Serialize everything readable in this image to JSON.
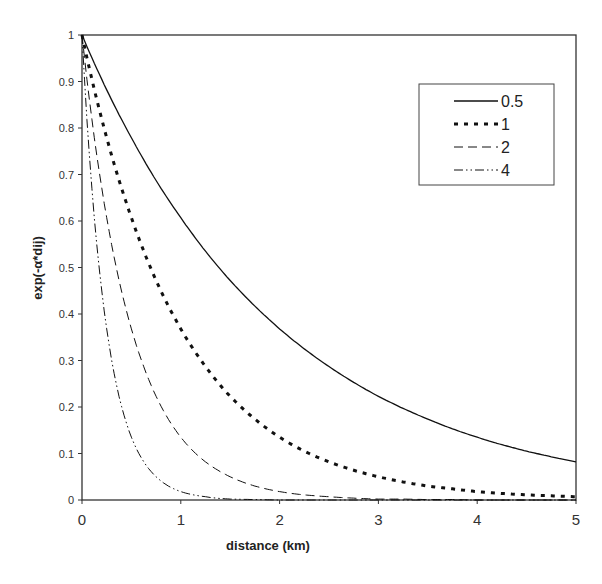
{
  "chart_data": {
    "type": "line",
    "title": "",
    "xlabel": "distance (km)",
    "ylabel": "exp(-α*dij)",
    "xlim": [
      0,
      5
    ],
    "ylim": [
      0,
      1
    ],
    "x_ticks": [
      "0",
      "1",
      "2",
      "3",
      "4",
      "5"
    ],
    "y_ticks": [
      "0",
      "0.1",
      "0.2",
      "0.3",
      "0.4",
      "0.5",
      "0.6",
      "0.7",
      "0.8",
      "0.9",
      "1"
    ],
    "grid": false,
    "legend_position": "upper right",
    "x": [
      0,
      0.25,
      0.5,
      0.75,
      1,
      1.25,
      1.5,
      1.75,
      2,
      2.25,
      2.5,
      2.75,
      3,
      3.25,
      3.5,
      3.75,
      4,
      4.25,
      4.5,
      4.75,
      5
    ],
    "series": [
      {
        "name": "0.5",
        "style": "solid",
        "values": [
          1,
          0.882,
          0.779,
          0.687,
          0.607,
          0.535,
          0.472,
          0.417,
          0.368,
          0.325,
          0.287,
          0.253,
          0.223,
          0.197,
          0.174,
          0.153,
          0.135,
          0.119,
          0.105,
          0.093,
          0.082
        ]
      },
      {
        "name": "1",
        "style": "dotted-bold",
        "values": [
          1,
          0.779,
          0.607,
          0.472,
          0.368,
          0.287,
          0.223,
          0.174,
          0.135,
          0.105,
          0.082,
          0.064,
          0.05,
          0.039,
          0.03,
          0.024,
          0.018,
          0.014,
          0.011,
          0.009,
          0.007
        ]
      },
      {
        "name": "2",
        "style": "dashed",
        "values": [
          1,
          0.607,
          0.368,
          0.223,
          0.135,
          0.082,
          0.05,
          0.03,
          0.018,
          0.011,
          0.007,
          0.004,
          0.002,
          0.002,
          0.001,
          0.001,
          0.0,
          0.0,
          0.0,
          0.0,
          0.0
        ]
      },
      {
        "name": "4",
        "style": "dash-dot-dot",
        "values": [
          1,
          0.368,
          0.135,
          0.05,
          0.018,
          0.007,
          0.002,
          0.001,
          0.0,
          0.0,
          0.0,
          0.0,
          0.0,
          0.0,
          0.0,
          0.0,
          0.0,
          0.0,
          0.0,
          0.0,
          0.0
        ]
      }
    ]
  }
}
